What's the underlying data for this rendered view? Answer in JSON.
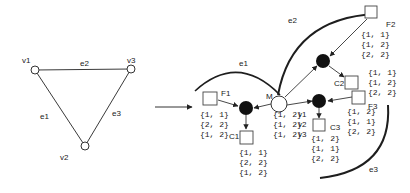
{
  "colors": {
    "stroke": "#3a3a3a",
    "node_fill_black": "#111111",
    "node_fill_white": "#ffffff",
    "arc": "#1e1e1e",
    "background": "#ffffff"
  },
  "left_graph": {
    "vertices": [
      {
        "id": "v1",
        "label": "v1"
      },
      {
        "id": "v2",
        "label": "v2"
      },
      {
        "id": "v3",
        "label": "v3"
      }
    ],
    "edges": [
      {
        "id": "e1",
        "label": "e1",
        "from": "v1",
        "to": "v2"
      },
      {
        "id": "e2",
        "label": "e2",
        "from": "v1",
        "to": "v3"
      },
      {
        "id": "e3",
        "label": "e3",
        "from": "v3",
        "to": "v2"
      }
    ]
  },
  "right_graph": {
    "arcs": [
      {
        "id": "e1",
        "label": "e1"
      },
      {
        "id": "e2",
        "label": "e2"
      },
      {
        "id": "e3",
        "label": "e3"
      }
    ],
    "M": {
      "label": "M",
      "rows": [
        {
          "value": "{1, 2}",
          "var": "v1"
        },
        {
          "value": "{1, 2}",
          "var": "v2"
        },
        {
          "value": "{1, 2}",
          "var": "v3"
        }
      ]
    },
    "F1": {
      "label": "F1",
      "values": [
        "{1, 1}",
        "{2, 2}",
        "{1, 2}"
      ]
    },
    "C1": {
      "label": "C1",
      "values": [
        "{1, 1}",
        "{2, 2}",
        "{1, 2}"
      ]
    },
    "F2": {
      "label": "F2",
      "values": [
        "{1, 1}",
        "{1, 2}",
        "{2, 2}"
      ]
    },
    "C2": {
      "label": "C2",
      "values": [
        "{1, 1}",
        "{1, 2}",
        "{2, 2}"
      ]
    },
    "F3": {
      "label": "F3",
      "values": [
        "{1, 2}",
        "{1, 1}",
        "{2, 2}"
      ]
    },
    "C3": {
      "label": "C3",
      "values": [
        "{1, 2}",
        "{1, 1}",
        "{2, 2}"
      ]
    }
  }
}
